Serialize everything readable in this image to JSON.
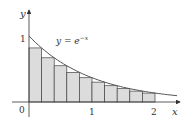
{
  "diagram": {
    "function_label": "y = e",
    "function_exponent": "−x",
    "axis_x_label": "x",
    "axis_y_label": "y",
    "origin_label": "0",
    "x_ticks": [
      {
        "value": 1,
        "label": "1"
      },
      {
        "value": 2,
        "label": "2"
      }
    ],
    "y_ticks": [
      {
        "value": 1,
        "label": "1"
      }
    ],
    "rectangles": {
      "count": 10,
      "interval": [
        0,
        2
      ],
      "method": "right-endpoint",
      "heights": [
        0.819,
        0.67,
        0.549,
        0.449,
        0.368,
        0.301,
        0.247,
        0.202,
        0.165,
        0.135
      ]
    },
    "colors": {
      "fill": "#dcdcdc",
      "stroke": "#444444",
      "curve": "#555555"
    }
  }
}
